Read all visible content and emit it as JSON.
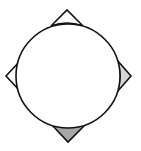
{
  "diagram": {
    "shapes": {
      "circle": {
        "fill": "#ffffff",
        "stroke": "#111111"
      },
      "corners": [
        {
          "name": "top",
          "fill": "#ffffff"
        },
        {
          "name": "right",
          "fill": "#d6d6d6"
        },
        {
          "name": "bottom",
          "fill": "#a6a6a6"
        },
        {
          "name": "left",
          "fill": "#ffffff"
        }
      ]
    }
  }
}
